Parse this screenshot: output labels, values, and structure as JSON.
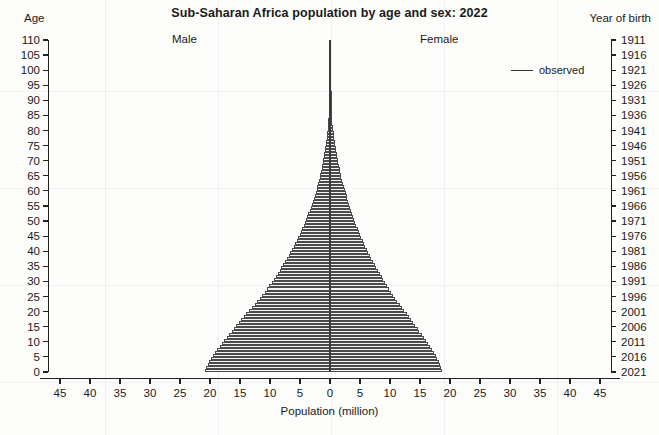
{
  "chart": {
    "title": "Sub-Saharan Africa population by age and sex: 2022",
    "left_axis_title": "Age",
    "right_axis_title": "Year of birth",
    "xlabel": "Population (million)",
    "male_label": "Male",
    "female_label": "Female",
    "legend": {
      "label": "observed",
      "marker": "line"
    },
    "axis_color": "#222222",
    "bar_outline_color": "#4a4a4a",
    "bar_fill_color": "#f4f4f2"
  },
  "chart_data": {
    "type": "bar",
    "subtype": "population-pyramid",
    "orientation": "horizontal",
    "title": "Sub-Saharan Africa population by age and sex: 2022",
    "xlabel": "Population (million)",
    "ylabel": "Age",
    "y2label": "Year of birth",
    "xlim": [
      -47,
      47
    ],
    "ylim": [
      0,
      110
    ],
    "grid": false,
    "legend_position": "top-right",
    "legend_entries": [
      "observed"
    ],
    "annotations": [
      "Male",
      "Female"
    ],
    "x_tick_labels": [
      "45",
      "40",
      "35",
      "30",
      "25",
      "20",
      "15",
      "10",
      "5",
      "0",
      "5",
      "10",
      "15",
      "20",
      "25",
      "30",
      "35",
      "40",
      "45"
    ],
    "x_tick_values": [
      -45,
      -40,
      -35,
      -30,
      -25,
      -20,
      -15,
      -10,
      -5,
      0,
      5,
      10,
      15,
      20,
      25,
      30,
      35,
      40,
      45
    ],
    "y_tick_labels": [
      "0",
      "5",
      "10",
      "15",
      "20",
      "25",
      "30",
      "35",
      "40",
      "45",
      "50",
      "55",
      "60",
      "65",
      "70",
      "75",
      "80",
      "85",
      "90",
      "95",
      "100",
      "105",
      "110"
    ],
    "y_tick_values": [
      0,
      5,
      10,
      15,
      20,
      25,
      30,
      35,
      40,
      45,
      50,
      55,
      60,
      65,
      70,
      75,
      80,
      85,
      90,
      95,
      100,
      105,
      110
    ],
    "y2_tick_labels": [
      "2021",
      "2016",
      "2011",
      "2006",
      "2001",
      "1996",
      "1991",
      "1986",
      "1981",
      "1976",
      "1971",
      "1966",
      "1961",
      "1956",
      "1951",
      "1946",
      "1941",
      "1936",
      "1931",
      "1926",
      "1921",
      "1916",
      "1911"
    ],
    "ages": [
      0,
      1,
      2,
      3,
      4,
      5,
      6,
      7,
      8,
      9,
      10,
      11,
      12,
      13,
      14,
      15,
      16,
      17,
      18,
      19,
      20,
      21,
      22,
      23,
      24,
      25,
      26,
      27,
      28,
      29,
      30,
      31,
      32,
      33,
      34,
      35,
      36,
      37,
      38,
      39,
      40,
      41,
      42,
      43,
      44,
      45,
      46,
      47,
      48,
      49,
      50,
      51,
      52,
      53,
      54,
      55,
      56,
      57,
      58,
      59,
      60,
      61,
      62,
      63,
      64,
      65,
      66,
      67,
      68,
      69,
      70,
      71,
      72,
      73,
      74,
      75,
      76,
      77,
      78,
      79,
      80,
      81,
      82,
      83,
      84,
      85,
      86,
      87,
      88,
      89,
      90,
      91,
      92,
      93,
      94,
      95,
      96,
      97,
      98,
      99,
      100,
      101,
      102,
      103,
      104,
      105,
      106,
      107,
      108,
      109,
      110
    ],
    "series": [
      {
        "name": "Male",
        "side": "left",
        "units": "million",
        "values": [
          20.9,
          20.6,
          20.3,
          20.1,
          19.8,
          19.5,
          19.1,
          18.8,
          18.4,
          18.0,
          17.6,
          17.2,
          16.8,
          16.4,
          16.0,
          15.6,
          15.2,
          14.8,
          14.4,
          14.0,
          13.5,
          13.0,
          12.5,
          12.1,
          11.7,
          11.3,
          10.9,
          10.5,
          10.1,
          9.7,
          9.4,
          9.0,
          8.7,
          8.4,
          8.1,
          7.8,
          7.5,
          7.2,
          6.9,
          6.6,
          6.3,
          6.0,
          5.8,
          5.5,
          5.3,
          5.0,
          4.8,
          4.6,
          4.4,
          4.2,
          4.0,
          3.8,
          3.6,
          3.4,
          3.2,
          3.0,
          2.85,
          2.7,
          2.55,
          2.4,
          2.25,
          2.1,
          1.95,
          1.8,
          1.7,
          1.6,
          1.5,
          1.4,
          1.3,
          1.2,
          1.1,
          1.0,
          0.92,
          0.84,
          0.77,
          0.7,
          0.63,
          0.57,
          0.51,
          0.45,
          0.4,
          0.35,
          0.3,
          0.26,
          0.22,
          0.19,
          0.16,
          0.13,
          0.11,
          0.09,
          0.07,
          0.055,
          0.044,
          0.034,
          0.026,
          0.02,
          0.015,
          0.011,
          0.008,
          0.006,
          0.004,
          0.003,
          0.002,
          0.0015,
          0.001,
          0.0007,
          0.0005,
          0.0003,
          0.0002,
          0.0001,
          5e-05
        ]
      },
      {
        "name": "Female",
        "side": "right",
        "units": "million",
        "values": [
          18.7,
          18.5,
          18.3,
          18.1,
          17.9,
          17.6,
          17.3,
          17.0,
          16.7,
          16.3,
          16.0,
          15.6,
          15.3,
          14.9,
          14.6,
          14.2,
          13.9,
          13.5,
          13.2,
          12.8,
          12.4,
          12.0,
          11.6,
          11.2,
          10.9,
          10.5,
          10.2,
          9.8,
          9.5,
          9.2,
          8.9,
          8.6,
          8.3,
          8.0,
          7.7,
          7.5,
          7.2,
          6.9,
          6.7,
          6.4,
          6.2,
          5.9,
          5.7,
          5.5,
          5.2,
          5.0,
          4.8,
          4.6,
          4.4,
          4.2,
          4.0,
          3.85,
          3.7,
          3.5,
          3.35,
          3.2,
          3.05,
          2.9,
          2.75,
          2.6,
          2.45,
          2.3,
          2.15,
          2.05,
          1.9,
          1.8,
          1.7,
          1.6,
          1.5,
          1.4,
          1.3,
          1.2,
          1.12,
          1.04,
          0.96,
          0.88,
          0.8,
          0.73,
          0.66,
          0.59,
          0.53,
          0.47,
          0.41,
          0.36,
          0.31,
          0.27,
          0.23,
          0.19,
          0.16,
          0.13,
          0.11,
          0.088,
          0.07,
          0.055,
          0.042,
          0.032,
          0.024,
          0.018,
          0.013,
          0.009,
          0.0065,
          0.0045,
          0.003,
          0.002,
          0.0014,
          0.001,
          0.0007,
          0.0004,
          0.00025,
          0.00015,
          8e-05
        ]
      }
    ]
  }
}
